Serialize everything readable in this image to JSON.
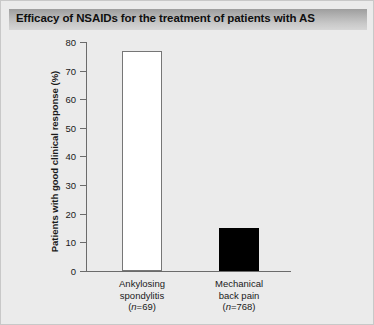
{
  "figure": {
    "title": "Efficacy of NSAIDs for the treatment of patients with AS",
    "background_color": "#ebebeb",
    "border_color": "#c8c8c8",
    "title_bar_color": "#b4b4b4"
  },
  "chart_data": {
    "type": "bar",
    "title": "Efficacy of NSAIDs for the treatment of patients with AS",
    "categories": [
      "Ankylosing spondylitis (n=69)",
      "Mechanical back pain (n=768)"
    ],
    "category_lines": [
      [
        "Ankylosing",
        "spondylitis",
        "(n=69)"
      ],
      [
        "Mechanical",
        "back pain",
        "(n=768)"
      ]
    ],
    "values": [
      77,
      15
    ],
    "bar_colors": [
      "#ffffff",
      "#000000"
    ],
    "bar_edge_colors": [
      "#767676",
      "#000000"
    ],
    "xlabel": "",
    "ylabel": "Patients with good clinical response (%)",
    "ylim": [
      0,
      80
    ],
    "ytick_values": [
      0,
      10,
      20,
      30,
      40,
      50,
      60,
      70,
      80
    ],
    "ytick_labels": [
      "0",
      "10",
      "20",
      "30",
      "40",
      "50",
      "60",
      "70",
      "80"
    ],
    "grid": false,
    "legend": false,
    "sample_sizes": [
      69,
      768
    ]
  },
  "axis": {
    "y_label": "Patients with good clinical response (%)",
    "ticks": [
      {
        "label": "80",
        "value": 80
      },
      {
        "label": "70",
        "value": 70
      },
      {
        "label": "60",
        "value": 60
      },
      {
        "label": "50",
        "value": 50
      },
      {
        "label": "40",
        "value": 40
      },
      {
        "label": "30",
        "value": 30
      },
      {
        "label": "20",
        "value": 20
      },
      {
        "label": "10",
        "value": 10
      },
      {
        "label": "0",
        "value": 0
      }
    ]
  },
  "categories": [
    {
      "line1": "Ankylosing",
      "line2": "spondylitis",
      "n_prefix": "(",
      "n_italic": "n",
      "n_suffix": "=69)",
      "value": 77
    },
    {
      "line1": "Mechanical",
      "line2": "back pain",
      "n_prefix": "(",
      "n_italic": "n",
      "n_suffix": "=768)",
      "value": 15
    }
  ]
}
